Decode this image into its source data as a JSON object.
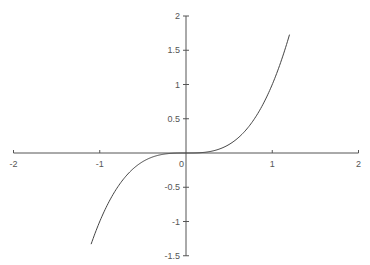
{
  "chart_data": {
    "type": "line",
    "title": "",
    "xlabel": "",
    "ylabel": "",
    "function": "y = x^3",
    "xlim": [
      -2,
      2
    ],
    "ylim": [
      -1.5,
      2
    ],
    "grid": false,
    "legend": null,
    "x_domain": [
      -1.1,
      1.2
    ],
    "x_ticks": [
      -2,
      -1,
      0,
      1,
      2
    ],
    "x_tick_labels": [
      "-2",
      "-1",
      "0",
      "1",
      "2"
    ],
    "y_ticks": [
      -1.5,
      -1,
      -0.5,
      0.5,
      1,
      1.5,
      2
    ],
    "y_tick_labels": [
      "-1.5",
      "-1",
      "-0.5",
      "0.5",
      "1",
      "1.5",
      "2"
    ],
    "series": [
      {
        "name": "x^3",
        "x": [
          -1.1,
          -1.0,
          -0.9,
          -0.8,
          -0.7,
          -0.6,
          -0.5,
          -0.4,
          -0.3,
          -0.2,
          -0.1,
          0.0,
          0.1,
          0.2,
          0.3,
          0.4,
          0.5,
          0.6,
          0.7,
          0.8,
          0.9,
          1.0,
          1.1,
          1.2
        ],
        "values": [
          -1.331,
          -1.0,
          -0.729,
          -0.512,
          -0.343,
          -0.216,
          -0.125,
          -0.064,
          -0.027,
          -0.008,
          -0.001,
          0.0,
          0.001,
          0.008,
          0.027,
          0.064,
          0.125,
          0.216,
          0.343,
          0.512,
          0.729,
          1.0,
          1.331,
          1.728
        ]
      }
    ],
    "colors": {
      "axis": "#555555",
      "curve": "#444444",
      "label": "#555555"
    }
  }
}
